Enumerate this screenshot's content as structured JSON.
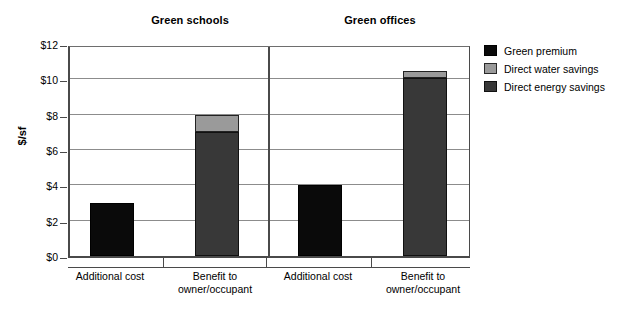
{
  "chart_data": {
    "type": "bar",
    "title": "",
    "subtitle": "",
    "xlabel": "",
    "ylabel": "$/sf",
    "ylim": [
      0,
      12
    ],
    "ytick_labels": [
      "$0",
      "$2",
      "$4",
      "$6",
      "$8",
      "$10",
      "$12"
    ],
    "ytick_values": [
      0,
      2,
      4,
      6,
      8,
      10,
      12
    ],
    "grid": true,
    "legend_position": "right",
    "stacked": true,
    "panels": [
      {
        "title": "Green schools",
        "categories": [
          "Additional cost",
          "Benefit to owner/occupant"
        ],
        "bars": [
          {
            "category": "Additional cost",
            "total": 3.0,
            "segments": [
              {
                "name": "Green premium",
                "value": 3.0,
                "color": "#0a0a0a"
              }
            ]
          },
          {
            "category": "Benefit to owner/occupant",
            "total": 8.0,
            "segments": [
              {
                "name": "Direct energy savings",
                "value": 7.0,
                "color": "#383838"
              },
              {
                "name": "Direct water savings",
                "value": 1.0,
                "color": "#9a9a9a"
              }
            ]
          }
        ]
      },
      {
        "title": "Green offices",
        "categories": [
          "Additional cost",
          "Benefit to owner/occupant"
        ],
        "bars": [
          {
            "category": "Additional cost",
            "total": 4.0,
            "segments": [
              {
                "name": "Green premium",
                "value": 4.0,
                "color": "#0a0a0a"
              }
            ]
          },
          {
            "category": "Benefit to owner/occupant",
            "total": 10.5,
            "segments": [
              {
                "name": "Direct energy savings",
                "value": 10.1,
                "color": "#383838"
              },
              {
                "name": "Direct water savings",
                "value": 0.4,
                "color": "#9a9a9a"
              }
            ]
          }
        ]
      }
    ],
    "series": [
      {
        "name": "Green premium",
        "color": "#0a0a0a",
        "values": [
          3.0,
          0,
          4.0,
          0
        ]
      },
      {
        "name": "Direct water savings",
        "color": "#9a9a9a",
        "values": [
          0,
          1.0,
          0,
          0.4
        ]
      },
      {
        "name": "Direct energy savings",
        "color": "#383838",
        "values": [
          0,
          7.0,
          0,
          10.1
        ]
      }
    ],
    "legend": [
      {
        "label": "Green premium",
        "color": "#0a0a0a"
      },
      {
        "label": "Direct water savings",
        "color": "#9a9a9a"
      },
      {
        "label": "Direct energy savings",
        "color": "#383838"
      }
    ]
  },
  "axis": {
    "y_title": "$/sf",
    "ticks": [
      {
        "label": "$12",
        "value": 12
      },
      {
        "label": "$10",
        "value": 10
      },
      {
        "label": "$8",
        "value": 8
      },
      {
        "label": "$6",
        "value": 6
      },
      {
        "label": "$4",
        "value": 4
      },
      {
        "label": "$2",
        "value": 2
      },
      {
        "label": "$0",
        "value": 0
      }
    ]
  },
  "panel_titles": {
    "schools": "Green schools",
    "offices": "Green offices"
  },
  "x_labels": [
    {
      "line1": "Additional cost",
      "line2": ""
    },
    {
      "line1": "Benefit to",
      "line2": "owner/occupant"
    },
    {
      "line1": "Additional cost",
      "line2": ""
    },
    {
      "line1": "Benefit to",
      "line2": "owner/occupant"
    }
  ],
  "legend": {
    "items": [
      {
        "label": "Green premium"
      },
      {
        "label": "Direct water savings"
      },
      {
        "label": "Direct energy savings"
      }
    ]
  }
}
